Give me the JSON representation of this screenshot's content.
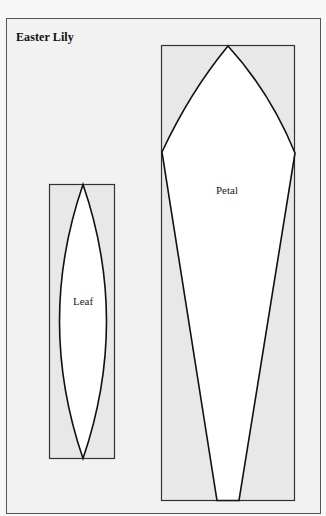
{
  "title": "Easter Lily",
  "pieces": [
    {
      "name": "leaf",
      "label": "Leaf"
    },
    {
      "name": "petal",
      "label": "Petal"
    }
  ],
  "colors": {
    "frame_fill": "#f2f2f2",
    "box_fill": "#e8e8e8",
    "shape_fill": "#ffffff",
    "stroke": "#111111"
  }
}
